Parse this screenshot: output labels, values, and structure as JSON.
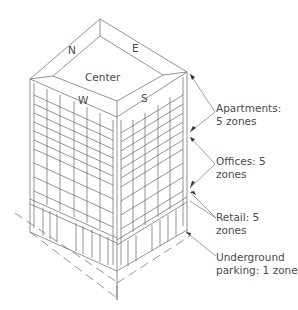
{
  "diagram": {
    "type": "isometric building zoning diagram",
    "roof_labels": {
      "north": "N",
      "east": "E",
      "west": "W",
      "south": "S",
      "center": "Center"
    },
    "zones": [
      {
        "name": "Apartments",
        "line1": "Apartments:",
        "line2": "5 zones"
      },
      {
        "name": "Offices",
        "line1": "Offices: 5",
        "line2": "zones"
      },
      {
        "name": "Retail",
        "line1": "Retail: 5",
        "line2": "zones"
      },
      {
        "name": "Underground parking",
        "line1": "Underground",
        "line2": "parking: 1 zone"
      }
    ],
    "colors": {
      "line": "#555555",
      "text": "#4a4a4a",
      "background": "#ffffff"
    }
  }
}
